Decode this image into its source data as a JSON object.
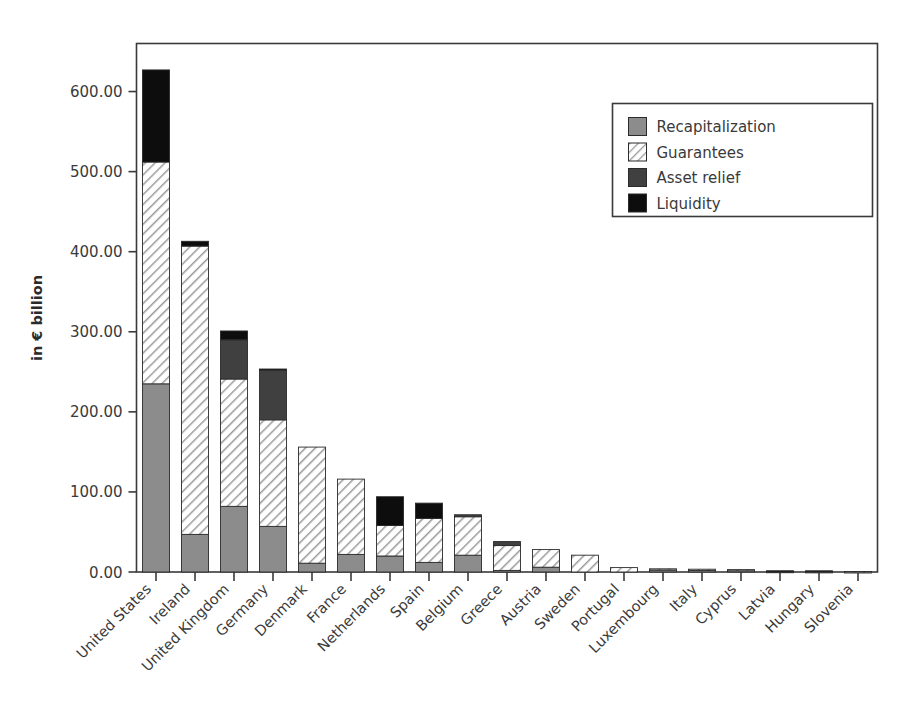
{
  "chart_data": {
    "type": "bar",
    "subtype": "stacked-vertical",
    "title": "",
    "subtitle": "",
    "xlabel": "",
    "ylabel": "in € billion",
    "ylim": [
      0,
      660
    ],
    "ytick_labels": [
      "0.00",
      "100.00",
      "200.00",
      "300.00",
      "400.00",
      "500.00",
      "600.00"
    ],
    "ytick_values": [
      0,
      100,
      200,
      300,
      400,
      500,
      600
    ],
    "grid": false,
    "legend_position": "upper-right",
    "categories": [
      "United States",
      "Ireland",
      "United Kingdom",
      "Germany",
      "Denmark",
      "France",
      "Netherlands",
      "Spain",
      "Belgium",
      "Greece",
      "Austria",
      "Sweden",
      "Portugal",
      "Luxembourg",
      "Italy",
      "Cyprus",
      "Latvia",
      "Hungary",
      "Slovenia"
    ],
    "series": [
      {
        "name": "Recapitalization",
        "fill": "solid",
        "color": "#8c8c8c",
        "values": [
          235.0,
          47.0,
          82.0,
          57.0,
          11.0,
          22.0,
          20.0,
          12.0,
          21.0,
          2.0,
          6.0,
          0.0,
          0.0,
          2.5,
          2.0,
          1.8,
          0.6,
          0.5,
          0.4
        ]
      },
      {
        "name": "Guarantees",
        "fill": "hatch",
        "color": "#ffffff",
        "values": [
          277.0,
          360.0,
          159.0,
          133.0,
          145.0,
          94.0,
          38.0,
          55.0,
          48.0,
          31.0,
          22.0,
          21.0,
          5.5,
          1.5,
          1.5,
          1.2,
          0.3,
          0.2,
          0.2
        ]
      },
      {
        "name": "Asset relief",
        "fill": "solid",
        "color": "#404040",
        "values": [
          0.0,
          0.0,
          49.0,
          62.0,
          0.0,
          0.0,
          0.0,
          0.0,
          2.5,
          5.0,
          0.0,
          0.0,
          0.0,
          0.0,
          0.0,
          0.0,
          0.0,
          0.0,
          0.0
        ]
      },
      {
        "name": "Liquidity",
        "fill": "solid",
        "color": "#0d0d0d",
        "values": [
          115.0,
          6.0,
          11.0,
          1.5,
          0.0,
          0.0,
          36.0,
          19.0,
          0.0,
          0.0,
          0.0,
          0.0,
          0.0,
          0.0,
          0.0,
          0.0,
          0.6,
          0.8,
          0.0
        ]
      }
    ],
    "totals": [
      627.0,
      413.0,
      301.0,
      253.5,
      156.0,
      116.0,
      94.0,
      86.0,
      71.5,
      38.0,
      28.0,
      21.0,
      5.5,
      4.0,
      3.5,
      3.0,
      1.5,
      1.5,
      0.6
    ]
  },
  "legend": {
    "entries": [
      {
        "label": "Recapitalization",
        "swatch": "solid-gray"
      },
      {
        "label": "Guarantees",
        "swatch": "hatch"
      },
      {
        "label": "Asset relief",
        "swatch": "solid-darkgray"
      },
      {
        "label": "Liquidity",
        "swatch": "solid-black"
      }
    ]
  },
  "colors": {
    "recapitalization": "#8c8c8c",
    "guarantees_bg": "#ffffff",
    "guarantees_hatch": "#9a9a9a",
    "asset_relief": "#404040",
    "liquidity": "#0d0d0d",
    "axis": "#3a3a3a",
    "background": "#ffffff"
  }
}
